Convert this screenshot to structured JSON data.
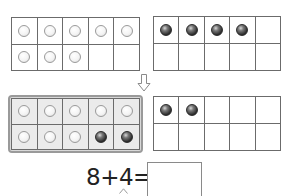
{
  "frames": [
    {
      "id": "g1",
      "name": "ten-frame-top-left",
      "shaded": false,
      "cells": [
        "white",
        "white",
        "white",
        "white",
        "white",
        "white",
        "white",
        "white",
        "empty",
        "empty"
      ]
    },
    {
      "id": "g2",
      "name": "ten-frame-top-right",
      "shaded": false,
      "cells": [
        "dark",
        "dark",
        "dark",
        "dark",
        "empty",
        "empty",
        "empty",
        "empty",
        "empty",
        "empty"
      ]
    },
    {
      "id": "g3",
      "name": "ten-frame-bottom-left-filled",
      "shaded": true,
      "cells": [
        "white",
        "white",
        "white",
        "white",
        "white",
        "white",
        "white",
        "white",
        "dark",
        "dark"
      ]
    },
    {
      "id": "g4",
      "name": "ten-frame-bottom-right",
      "shaded": false,
      "cells": [
        "dark",
        "dark",
        "empty",
        "empty",
        "empty",
        "empty",
        "empty",
        "empty",
        "empty",
        "empty"
      ]
    }
  ],
  "arrow_icon": "down-arrow-outline",
  "equation": {
    "text": "8+4=",
    "answer": ""
  },
  "colors": {
    "grid_line": "#6b6b6b",
    "shaded_cell": "#ebebeb",
    "dark_counter": "#2e2e2e",
    "white_counter": "#f4f4f4"
  }
}
